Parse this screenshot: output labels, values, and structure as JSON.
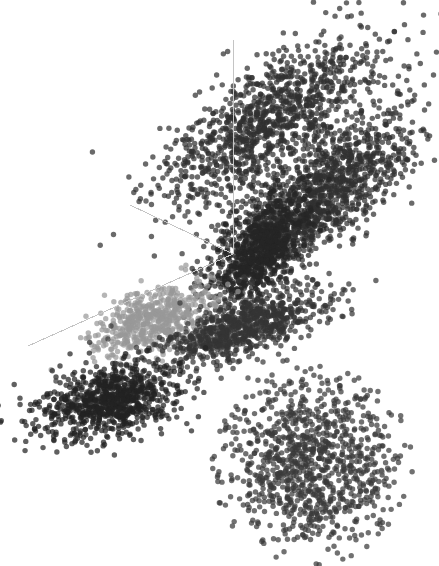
{
  "figure": {
    "title": "",
    "background_color": "#ffffff",
    "width": 439,
    "height": 566,
    "has_axis_labels": false,
    "has_tick_labels": false,
    "has_legend": false,
    "has_title": false
  },
  "axes": {
    "style": "3d-corner-tripod",
    "color": "#c4c4c4",
    "line_width": 1,
    "origin": {
      "x": 233,
      "y": 254
    },
    "arms": [
      {
        "name": "vertical-axis",
        "label": "",
        "x2": 233,
        "y2": 40
      },
      {
        "name": "left-depth-axis",
        "label": "",
        "x2": 130,
        "y2": 205
      },
      {
        "name": "lower-left-axis",
        "label": "",
        "x2": 28,
        "y2": 346
      }
    ]
  },
  "chart_data": {
    "type": "scatter",
    "title": "",
    "xlabel": "",
    "ylabel": "",
    "zlabel": "",
    "grid": false,
    "legend_position": "none",
    "projection": "3d",
    "marker": {
      "shape": "circle",
      "size_px": 5.4,
      "opacity": 0.72
    },
    "xlim": [
      0,
      439
    ],
    "ylim": [
      566,
      0
    ],
    "total_points": 6360,
    "clusters": [
      {
        "name": "upper-diagonal-band",
        "color": "#303030",
        "n": 1150,
        "center": [
          272,
          118
        ],
        "spread": [
          62,
          26
        ],
        "angle_deg": -36,
        "seed": 11,
        "shape": "elongated"
      },
      {
        "name": "second-diagonal-band",
        "color": "#303030",
        "n": 1250,
        "center": [
          318,
          200
        ],
        "spread": [
          62,
          21
        ],
        "angle_deg": -40,
        "seed": 23,
        "shape": "elongated"
      },
      {
        "name": "origin-dense-head",
        "color": "#262626",
        "n": 760,
        "center": [
          258,
          252
        ],
        "spread": [
          34,
          18
        ],
        "angle_deg": -55,
        "seed": 37,
        "shape": "elongated"
      },
      {
        "name": "light-gray-cluster",
        "color": "#999999",
        "n": 560,
        "center": [
          152,
          320
        ],
        "spread": [
          30,
          15
        ],
        "angle_deg": -22,
        "seed": 53,
        "shape": "elongated"
      },
      {
        "name": "mid-right-band",
        "color": "#343434",
        "n": 780,
        "center": [
          245,
          328
        ],
        "spread": [
          42,
          13
        ],
        "angle_deg": -20,
        "seed": 67,
        "shape": "elongated"
      },
      {
        "name": "lower-left-ellipse",
        "color": "#222222",
        "n": 860,
        "center": [
          109,
          401
        ],
        "spread": [
          36,
          17
        ],
        "angle_deg": -12,
        "seed": 79,
        "shape": "elongated"
      },
      {
        "name": "bottom-right-blob",
        "color": "#3a3a3a",
        "n": 1000,
        "center": [
          312,
          464
        ],
        "spread": [
          44,
          44
        ],
        "angle_deg": 0,
        "seed": 97,
        "shape": "round"
      }
    ],
    "outliers": [
      {
        "x": 146,
        "y": 201,
        "color": "#3a3a3a"
      },
      {
        "x": 185,
        "y": 216,
        "color": "#3a3a3a"
      },
      {
        "x": 167,
        "y": 174,
        "color": "#3a3a3a"
      },
      {
        "x": 205,
        "y": 171,
        "color": "#3a3a3a"
      },
      {
        "x": 224,
        "y": 163,
        "color": "#3a3a3a"
      },
      {
        "x": 200,
        "y": 189,
        "color": "#3a3a3a"
      },
      {
        "x": 232,
        "y": 188,
        "color": "#3a3a3a"
      },
      {
        "x": 249,
        "y": 186,
        "color": "#3a3a3a"
      },
      {
        "x": 219,
        "y": 281,
        "color": "#3a3a3a"
      },
      {
        "x": 244,
        "y": 277,
        "color": "#3a3a3a"
      },
      {
        "x": 180,
        "y": 303,
        "color": "#3a3a3a"
      },
      {
        "x": 111,
        "y": 326,
        "color": "#3a3a3a"
      },
      {
        "x": 108,
        "y": 339,
        "color": "#3a3a3a"
      },
      {
        "x": 226,
        "y": 352,
        "color": "#3a3a3a"
      },
      {
        "x": 263,
        "y": 362,
        "color": "#3a3a3a"
      },
      {
        "x": 283,
        "y": 361,
        "color": "#3a3a3a"
      },
      {
        "x": 396,
        "y": 113,
        "color": "#4a4a4a"
      },
      {
        "x": 341,
        "y": 37,
        "color": "#3a3a3a"
      },
      {
        "x": 232,
        "y": 415,
        "color": "#3a3a3a"
      },
      {
        "x": 246,
        "y": 397,
        "color": "#3a3a3a"
      },
      {
        "x": 225,
        "y": 430,
        "color": "#3a3a3a"
      },
      {
        "x": 235,
        "y": 450,
        "color": "#3a3a3a"
      },
      {
        "x": 260,
        "y": 393,
        "color": "#3a3a3a"
      },
      {
        "x": 248,
        "y": 378,
        "color": "#3a3a3a"
      },
      {
        "x": 117,
        "y": 364,
        "color": "#3a3a3a"
      },
      {
        "x": 56,
        "y": 381,
        "color": "#3a3a3a"
      },
      {
        "x": 76,
        "y": 437,
        "color": "#3a3a3a"
      },
      {
        "x": 382,
        "y": 472,
        "color": "#5a5a5a"
      }
    ]
  }
}
